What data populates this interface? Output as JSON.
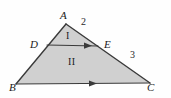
{
  "figure": {
    "type": "geometry-diagram",
    "background_color": "#fefefe",
    "fill_color": "#d0d0d0",
    "stroke_color": "#3a3a3a"
  },
  "vertices": [
    {
      "name": "A",
      "label": "A",
      "label_x": 60,
      "label_y": 10,
      "point_x": 66,
      "point_y": 24
    },
    {
      "name": "B",
      "label": "B",
      "label_x": 9,
      "label_y": 82,
      "point_x": 16,
      "point_y": 84
    },
    {
      "name": "C",
      "label": "C",
      "label_x": 147,
      "label_y": 82,
      "point_x": 150,
      "point_y": 83
    },
    {
      "name": "D",
      "label": "D",
      "label_x": 30,
      "label_y": 39,
      "point_x": 47,
      "point_y": 45
    },
    {
      "name": "E",
      "label": "E",
      "label_x": 104,
      "label_y": 39,
      "point_x": 98,
      "point_y": 46
    }
  ],
  "angle_labels": [
    {
      "name": "angle-2",
      "label": "2",
      "x": 81,
      "y": 17
    },
    {
      "name": "angle-3",
      "label": "3",
      "x": 130,
      "y": 50
    }
  ],
  "region_labels": [
    {
      "name": "region-I",
      "label": "I",
      "x": 66,
      "y": 31
    },
    {
      "name": "region-II",
      "label": "II",
      "x": 68,
      "y": 57
    }
  ],
  "segments": {
    "side_ab": {
      "name": "side-AB",
      "x1": 66,
      "y1": 24,
      "x2": 16,
      "y2": 84
    },
    "side_ac": {
      "name": "side-AC",
      "x1": 66,
      "y1": 24,
      "x2": 150,
      "y2": 83
    },
    "side_bc": {
      "name": "side-BC",
      "x1": 16,
      "y1": 84,
      "x2": 150,
      "y2": 83
    },
    "segment_de": {
      "name": "segment-DE",
      "x1": 47,
      "y1": 45,
      "x2": 98,
      "y2": 46
    }
  },
  "arrow_markers": [
    {
      "name": "arrow-on-DE",
      "x": 88,
      "y": 45.7,
      "direction": "right"
    },
    {
      "name": "arrow-on-BC",
      "x": 93,
      "y": 83.5,
      "direction": "right"
    }
  ]
}
